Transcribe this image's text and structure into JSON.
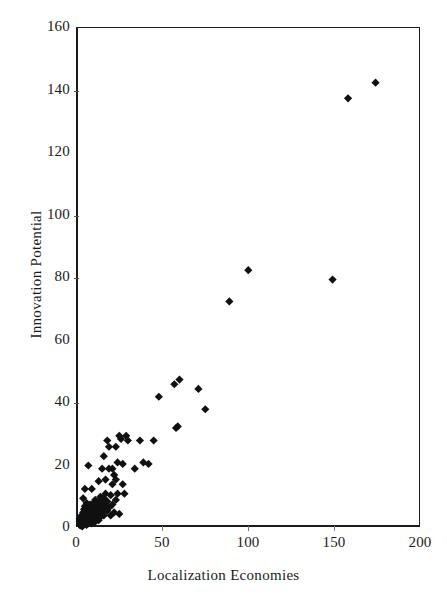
{
  "chart_data": {
    "type": "scatter",
    "title": "",
    "xlabel": "Localization Economies",
    "ylabel": "Innovation Potential",
    "xlim": [
      0,
      200
    ],
    "ylim": [
      0,
      160
    ],
    "xticks": [
      0,
      50,
      100,
      150,
      200
    ],
    "yticks": [
      0,
      20,
      40,
      60,
      80,
      100,
      120,
      140,
      160
    ],
    "grid": false,
    "legend": null,
    "marker": "filled-diamond",
    "marker_color": "#111111",
    "marker_size": 7,
    "series": [
      {
        "name": "observations",
        "points": [
          [
            1,
            1
          ],
          [
            1,
            2
          ],
          [
            1,
            3
          ],
          [
            1.5,
            0.8
          ],
          [
            2,
            1.5
          ],
          [
            2,
            2.5
          ],
          [
            2,
            4
          ],
          [
            2.5,
            0.5
          ],
          [
            2.5,
            3
          ],
          [
            3,
            1
          ],
          [
            3,
            2
          ],
          [
            3,
            5
          ],
          [
            3,
            9.5
          ],
          [
            3.5,
            6
          ],
          [
            4,
            1.5
          ],
          [
            4,
            3.5
          ],
          [
            4,
            7
          ],
          [
            4,
            12.5
          ],
          [
            4.5,
            2
          ],
          [
            5,
            1
          ],
          [
            5,
            4
          ],
          [
            5,
            5.5
          ],
          [
            5,
            8
          ],
          [
            5.5,
            2.5
          ],
          [
            6,
            1.5
          ],
          [
            6,
            3
          ],
          [
            6,
            6.5
          ],
          [
            6,
            20
          ],
          [
            6.5,
            4.5
          ],
          [
            7,
            2
          ],
          [
            7,
            5
          ],
          [
            7,
            7.5
          ],
          [
            7.5,
            3.5
          ],
          [
            8,
            1.5
          ],
          [
            8,
            4
          ],
          [
            8,
            6
          ],
          [
            8,
            12.5
          ],
          [
            8.5,
            2.5
          ],
          [
            9,
            3
          ],
          [
            9,
            5.5
          ],
          [
            9,
            8
          ],
          [
            9.5,
            4
          ],
          [
            10,
            2
          ],
          [
            10,
            6.5
          ],
          [
            10,
            9
          ],
          [
            10.5,
            3
          ],
          [
            11,
            5
          ],
          [
            11,
            7.5
          ],
          [
            11.5,
            4
          ],
          [
            12,
            2.5
          ],
          [
            12,
            6
          ],
          [
            12,
            8.5
          ],
          [
            12,
            15
          ],
          [
            13,
            3.5
          ],
          [
            13,
            7
          ],
          [
            13,
            10
          ],
          [
            14,
            5
          ],
          [
            14,
            8
          ],
          [
            14,
            19
          ],
          [
            14.5,
            6
          ],
          [
            15,
            4
          ],
          [
            15,
            9.5
          ],
          [
            15,
            23
          ],
          [
            16,
            7
          ],
          [
            16,
            11
          ],
          [
            16,
            15.5
          ],
          [
            17,
            5.5
          ],
          [
            17,
            8.5
          ],
          [
            17,
            28
          ],
          [
            18,
            6.5
          ],
          [
            18,
            19
          ],
          [
            18,
            26
          ],
          [
            19,
            4
          ],
          [
            19,
            10.5
          ],
          [
            20,
            7.5
          ],
          [
            20,
            14
          ],
          [
            20,
            19
          ],
          [
            21,
            5
          ],
          [
            21,
            17
          ],
          [
            22,
            9
          ],
          [
            22,
            15.5
          ],
          [
            22,
            26
          ],
          [
            23,
            11
          ],
          [
            23,
            21
          ],
          [
            24,
            4.5
          ],
          [
            24,
            29.5
          ],
          [
            25,
            28.5
          ],
          [
            26,
            14
          ],
          [
            26,
            20.5
          ],
          [
            27,
            11
          ],
          [
            28,
            29.5
          ],
          [
            29,
            28
          ],
          [
            33,
            19
          ],
          [
            36,
            28
          ],
          [
            38,
            21
          ],
          [
            41,
            20.5
          ],
          [
            44,
            28
          ],
          [
            47,
            42
          ],
          [
            56,
            46
          ],
          [
            57,
            32
          ],
          [
            58,
            32.5
          ],
          [
            59,
            47.5
          ],
          [
            70,
            44.5
          ],
          [
            74,
            38
          ],
          [
            88,
            72.5
          ],
          [
            99,
            82.5
          ],
          [
            148,
            79.5
          ],
          [
            157,
            137.5
          ],
          [
            173,
            142.5
          ]
        ]
      }
    ]
  },
  "axes": {
    "y_tick_labels": [
      "160",
      "140",
      "120",
      "100",
      "80",
      "60",
      "40",
      "20",
      "0"
    ],
    "x_tick_labels": [
      "0",
      "50",
      "100",
      "150",
      "200"
    ],
    "x_axis_title": "Localization Economies",
    "y_axis_title": "Innovation Potential"
  }
}
